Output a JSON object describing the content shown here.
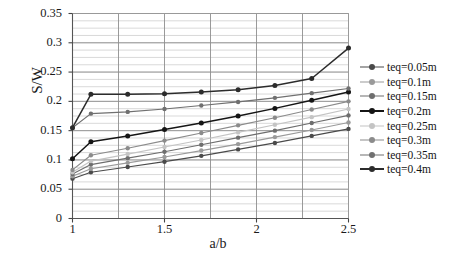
{
  "chart_data": {
    "type": "line",
    "title": "",
    "xlabel": "a/b",
    "ylabel": "S/W",
    "xlim": [
      1,
      2.5
    ],
    "ylim": [
      0,
      0.35
    ],
    "xticks": [
      "1",
      "1.5",
      "2",
      "2.5"
    ],
    "xtick_values": [
      1,
      1.5,
      2,
      2.5
    ],
    "yticks": [
      "0",
      "0.05",
      "0.1",
      "0.15",
      "0.2",
      "0.25",
      "0.3",
      "0.35"
    ],
    "ytick_values": [
      0,
      0.05,
      0.1,
      0.15,
      0.2,
      0.25,
      0.3,
      0.35
    ],
    "grid": true,
    "grid_major_x": [
      1,
      1.25,
      1.5,
      1.75,
      2,
      2.25,
      2.5
    ],
    "grid_minor_y_step": 0.0125,
    "legend_position": "right",
    "x": [
      1,
      1.1,
      1.3,
      1.5,
      1.7,
      1.9,
      2.1,
      2.3,
      2.5
    ],
    "series": [
      {
        "name": "teq=0.05m",
        "color": "#4a4a4a",
        "values": [
          0.068,
          0.079,
          0.088,
          0.097,
          0.107,
          0.118,
          0.129,
          0.141,
          0.153
        ]
      },
      {
        "name": "teq=0.1m",
        "color": "#9a9a9a",
        "values": [
          0.072,
          0.085,
          0.095,
          0.105,
          0.116,
          0.127,
          0.139,
          0.151,
          0.164
        ]
      },
      {
        "name": "teq=0.15m",
        "color": "#6e6e6e",
        "values": [
          0.076,
          0.092,
          0.103,
          0.114,
          0.126,
          0.138,
          0.15,
          0.163,
          0.176
        ]
      },
      {
        "name": "teq=0.2m",
        "color": "#151515",
        "values": [
          0.102,
          0.131,
          0.141,
          0.152,
          0.163,
          0.175,
          0.188,
          0.202,
          0.216
        ]
      },
      {
        "name": "teq=0.25m",
        "color": "#c4c4c4",
        "values": [
          0.079,
          0.098,
          0.11,
          0.122,
          0.134,
          0.147,
          0.16,
          0.173,
          0.187
        ]
      },
      {
        "name": "teq=0.3m",
        "color": "#8b8b8b",
        "values": [
          0.083,
          0.108,
          0.12,
          0.133,
          0.146,
          0.159,
          0.172,
          0.186,
          0.2
        ]
      },
      {
        "name": "teq=0.35m",
        "color": "#707070",
        "values": [
          0.155,
          0.179,
          0.182,
          0.187,
          0.193,
          0.199,
          0.206,
          0.214,
          0.222
        ]
      },
      {
        "name": "teq=0.4m",
        "color": "#2c2c2c",
        "values": [
          0.155,
          0.212,
          0.212,
          0.213,
          0.216,
          0.22,
          0.227,
          0.239,
          0.291
        ]
      }
    ]
  },
  "legend": {
    "items": [
      {
        "label": "teq=0.05m"
      },
      {
        "label": "teq=0.1m"
      },
      {
        "label": "teq=0.15m"
      },
      {
        "label": "teq=0.2m"
      },
      {
        "label": "teq=0.25m"
      },
      {
        "label": "teq=0.3m"
      },
      {
        "label": "teq=0.35m"
      },
      {
        "label": "teq=0.4m"
      }
    ]
  }
}
